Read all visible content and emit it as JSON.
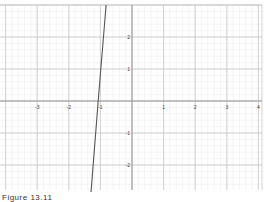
{
  "chart_data": {
    "type": "line",
    "title": "",
    "xlabel": "",
    "ylabel": "",
    "xlim": [
      -4.1,
      4.0
    ],
    "ylim": [
      -2.8,
      3.0
    ],
    "grid": true,
    "minor_grid_divisions": 5,
    "x_ticks": [
      -3,
      -2,
      -1,
      1,
      2,
      3,
      4
    ],
    "y_ticks": [
      2,
      1,
      -1,
      -2
    ],
    "series": [
      {
        "name": "line",
        "color": "#555555",
        "points": [
          [
            -0.82,
            3.0
          ],
          [
            -1.07,
            0.0
          ],
          [
            -1.3,
            -2.9
          ]
        ]
      }
    ],
    "legend": null
  },
  "caption": "Figure 13.11",
  "colors": {
    "axis": "#999999",
    "major_grid": "#c8c8c8",
    "minor_grid": "#ececec",
    "line": "#555555",
    "tick_label": "#444444"
  },
  "layout": {
    "origin_px": [
      132,
      101
    ],
    "unit_px_x": 31.6,
    "unit_px_y": 32,
    "plot_top": 5,
    "plot_bottom": 190,
    "plot_left": 0,
    "plot_right": 262
  }
}
